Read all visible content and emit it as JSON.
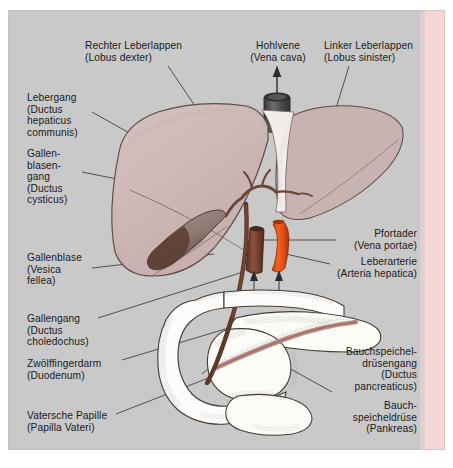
{
  "figure": {
    "language": "de",
    "panel_background": "#c9c9c9",
    "page_background": "#ffffff",
    "accent_strip_color": "#f4d6d6"
  },
  "palette": {
    "liver": "#cdb8b6",
    "liver_outline": "#5a4a48",
    "liver_left_lobe": "#c8b2b0",
    "gallbladder": "#9c8c88",
    "gallbladder_fundus": "#6b4a3e",
    "bile_duct": "#6d4436",
    "vena_cava": "#5a5a5a",
    "vena_cava_dark": "#3f3f3f",
    "portal_vein": "#7c4434",
    "hepatic_artery": "#e8521d",
    "duodenum": "#fdfdfb",
    "duodenum_outline": "#4a4038",
    "pancreas": "#fbfbf8",
    "pancreatic_duct": "#c08d86",
    "leader_line": "#3a3a3a",
    "text": "#1a1a1a"
  },
  "labels": [
    {
      "id": "rechter-leberlappen",
      "name": "Rechter Leberlappen",
      "lines": [
        "Rechter Leberlappen",
        "(Lobus dexter)"
      ],
      "align": "left",
      "x": 85,
      "y": 40,
      "structure": "right-liver-lobe"
    },
    {
      "id": "hohlvene",
      "name": "Hohlvene",
      "lines": [
        "Hohlvene",
        "(Vena cava)"
      ],
      "align": "center",
      "x": 243,
      "y": 40,
      "structure": "inferior-vena-cava"
    },
    {
      "id": "linker-leberlappen",
      "name": "Linker Leberlappen",
      "lines": [
        "Linker Leberlappen",
        "(Lobus sinister)"
      ],
      "align": "left",
      "x": 324,
      "y": 40,
      "structure": "left-liver-lobe"
    },
    {
      "id": "lebergang",
      "name": "Lebergang",
      "lines": [
        "Lebergang",
        "(Ductus",
        "hepaticus",
        "communis)"
      ],
      "align": "left",
      "x": 27,
      "y": 92,
      "structure": "common-hepatic-duct"
    },
    {
      "id": "gallenblasengang",
      "name": "Gallenblasengang",
      "lines": [
        "Gallen-",
        "blasen-",
        "gang",
        "(Ductus",
        "cysticus)"
      ],
      "align": "left",
      "x": 27,
      "y": 148,
      "structure": "cystic-duct"
    },
    {
      "id": "gallenblase",
      "name": "Gallenblase",
      "lines": [
        "Gallenblase",
        "(Vesica",
        "fellea)"
      ],
      "align": "left",
      "x": 27,
      "y": 252,
      "structure": "gallbladder"
    },
    {
      "id": "gallengang",
      "name": "Gallengang",
      "lines": [
        "Gallengang",
        "(Ductus",
        "choledochus)"
      ],
      "align": "left",
      "x": 27,
      "y": 313,
      "structure": "common-bile-duct"
    },
    {
      "id": "zwoelffingerdarm",
      "name": "Zwoelffingerdarm",
      "lines": [
        "Zwölffingerdarm",
        "(Duodenum)"
      ],
      "align": "left",
      "x": 27,
      "y": 358,
      "structure": "duodenum"
    },
    {
      "id": "vatersche-papille",
      "name": "Vatersche Papille",
      "lines": [
        "Vatersche Papille",
        "(Papilla Vateri)"
      ],
      "align": "left",
      "x": 27,
      "y": 410,
      "structure": "ampulla-of-vater"
    },
    {
      "id": "pfortader",
      "name": "Pfortader",
      "lines": [
        "Pfortader",
        "(Vena portae)"
      ],
      "align": "right",
      "x": 417,
      "y": 228,
      "structure": "portal-vein"
    },
    {
      "id": "leberarterie",
      "name": "Leberarterie",
      "lines": [
        "Leberarterie",
        "(Arteria hepatica)"
      ],
      "align": "right",
      "x": 417,
      "y": 256,
      "structure": "hepatic-artery"
    },
    {
      "id": "bauchspeicheldruesengang",
      "name": "Bauchspeicheldrüsengang",
      "lines": [
        "Bauchspeichel-",
        "drüsengang",
        "(Ductus",
        "pancreaticus)"
      ],
      "align": "right",
      "x": 417,
      "y": 346,
      "structure": "pancreatic-duct"
    },
    {
      "id": "bauchspeicheldruese",
      "name": "Bauchspeicheldrüse",
      "lines": [
        "Bauch-",
        "speicheldrüse",
        "(Pankreas)"
      ],
      "align": "right",
      "x": 417,
      "y": 400,
      "structure": "pancreas"
    }
  ],
  "structures": [
    {
      "id": "right-liver-lobe",
      "label": "Rechter Leberlappen (Lobus dexter)"
    },
    {
      "id": "left-liver-lobe",
      "label": "Linker Leberlappen (Lobus sinister)"
    },
    {
      "id": "inferior-vena-cava",
      "label": "Hohlvene (Vena cava)"
    },
    {
      "id": "common-hepatic-duct",
      "label": "Lebergang (Ductus hepaticus communis)"
    },
    {
      "id": "cystic-duct",
      "label": "Gallenblasengang (Ductus cysticus)"
    },
    {
      "id": "gallbladder",
      "label": "Gallenblase (Vesica fellea)"
    },
    {
      "id": "common-bile-duct",
      "label": "Gallengang (Ductus choledochus)"
    },
    {
      "id": "duodenum",
      "label": "Zwölffingerdarm (Duodenum)"
    },
    {
      "id": "ampulla-of-vater",
      "label": "Vatersche Papille (Papilla Vateri)"
    },
    {
      "id": "portal-vein",
      "label": "Pfortader (Vena portae)"
    },
    {
      "id": "hepatic-artery",
      "label": "Leberarterie (Arteria hepatica)"
    },
    {
      "id": "pancreatic-duct",
      "label": "Bauchspeicheldrüsengang (Ductus pancreaticus)"
    },
    {
      "id": "pancreas",
      "label": "Bauchspeicheldrüse (Pankreas)"
    }
  ]
}
